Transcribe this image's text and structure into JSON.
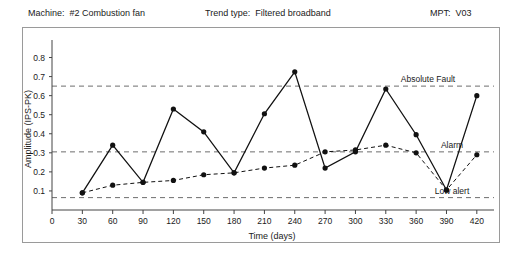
{
  "header": {
    "machine_label": "Machine:",
    "machine_value": "#2  Combustion fan",
    "trend_label": "Trend type:",
    "trend_value": "Filtered broadband",
    "mpt_label": "MPT:",
    "mpt_value": "V03"
  },
  "chart_data": {
    "type": "line",
    "title": "",
    "xlabel": "Time (days)",
    "ylabel": "Amplitude (IPS-PK)",
    "xlim": [
      0,
      435
    ],
    "ylim": [
      0,
      0.85
    ],
    "xticks": [
      0,
      30,
      60,
      90,
      120,
      150,
      180,
      210,
      240,
      270,
      300,
      330,
      360,
      390,
      420
    ],
    "yticks": [
      0.1,
      0.2,
      0.3,
      0.4,
      0.5,
      0.6,
      0.7,
      0.8
    ],
    "grid": false,
    "legend": "none",
    "series": [
      {
        "name": "Measured amplitude",
        "style": "solid",
        "x": [
          30,
          60,
          90,
          120,
          150,
          180,
          210,
          240,
          270,
          300,
          330,
          360,
          390,
          420
        ],
        "values": [
          0.09,
          0.34,
          0.145,
          0.53,
          0.41,
          0.195,
          0.505,
          0.725,
          0.22,
          0.305,
          0.635,
          0.395,
          0.105,
          0.6
        ]
      },
      {
        "name": "Trend average",
        "style": "dashed",
        "x": [
          30,
          60,
          90,
          120,
          150,
          180,
          210,
          240,
          270,
          300,
          330,
          360,
          390,
          420
        ],
        "values": [
          0.09,
          0.13,
          0.145,
          0.155,
          0.185,
          0.195,
          0.22,
          0.235,
          0.305,
          0.315,
          0.34,
          0.3,
          0.105,
          0.29
        ]
      }
    ],
    "thresholds": [
      {
        "name": "Absolute Fault",
        "value": 0.65,
        "label": "Absolute Fault"
      },
      {
        "name": "Alarm",
        "value": 0.305,
        "label": "Alarm"
      },
      {
        "name": "Low alert",
        "value": 0.065,
        "label": "Low alert"
      }
    ]
  }
}
